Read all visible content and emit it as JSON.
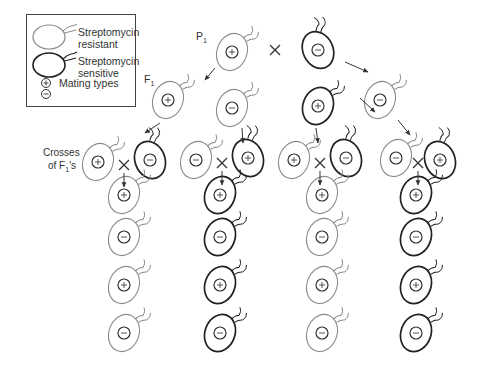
{
  "legend": {
    "resistant_line1": "Streptomycin",
    "resistant_line2": "resistant",
    "sensitive_line1": "Streptomycin",
    "sensitive_line2": "sensitive",
    "mating_types": "Mating types",
    "plus_symbol": "+",
    "minus_symbol": "−"
  },
  "labels": {
    "p1": "P",
    "p1_sub": "1",
    "f1": "F",
    "f1_sub": "1",
    "crosses_line1": "Crosses",
    "crosses_line2": "of F",
    "crosses_sub": "1",
    "crosses_suffix": "'s",
    "cross_symbol": "×"
  },
  "colors": {
    "resistant_stroke": "#8a8a8a",
    "sensitive_stroke": "#222222",
    "arrow": "#333333",
    "background": "#ffffff"
  },
  "generations": {
    "p1": [
      {
        "mating": "+",
        "type": "resistant",
        "x": 232,
        "y": 52
      },
      {
        "mating": "−",
        "type": "sensitive",
        "x": 318,
        "y": 50
      }
    ],
    "f1": [
      {
        "mating": "+",
        "type": "resistant",
        "x": 168,
        "y": 100
      },
      {
        "mating": "−",
        "type": "resistant",
        "x": 232,
        "y": 108
      },
      {
        "mating": "+",
        "type": "sensitive",
        "x": 318,
        "y": 106
      },
      {
        "mating": "−",
        "type": "resistant",
        "x": 380,
        "y": 100
      }
    ],
    "f1_crosses": [
      {
        "left": {
          "mating": "+",
          "type": "resistant",
          "x": 98,
          "y": 162
        },
        "right": {
          "mating": "−",
          "type": "sensitive",
          "x": 150,
          "y": 160
        }
      },
      {
        "left": {
          "mating": "−",
          "type": "resistant",
          "x": 196,
          "y": 160
        },
        "right": {
          "mating": "+",
          "type": "sensitive",
          "x": 248,
          "y": 158
        }
      },
      {
        "left": {
          "mating": "+",
          "type": "resistant",
          "x": 294,
          "y": 160
        },
        "right": {
          "mating": "−",
          "type": "sensitive",
          "x": 346,
          "y": 158
        }
      },
      {
        "left": {
          "mating": "−",
          "type": "resistant",
          "x": 396,
          "y": 158
        },
        "right": {
          "mating": "+",
          "type": "sensitive",
          "x": 440,
          "y": 160
        }
      }
    ],
    "offspring_columns": [
      {
        "type": "resistant",
        "x": 124,
        "cells": [
          "+",
          "−",
          "+",
          "−"
        ]
      },
      {
        "type": "sensitive",
        "x": 220,
        "cells": [
          "+",
          "−",
          "+",
          "−"
        ]
      },
      {
        "type": "resistant",
        "x": 322,
        "cells": [
          "+",
          "−",
          "+",
          "−"
        ]
      },
      {
        "type": "sensitive",
        "x": 416,
        "cells": [
          "+",
          "−",
          "+",
          "−"
        ]
      }
    ],
    "offspring_rows_y": [
      195,
      237,
      285,
      333
    ]
  }
}
